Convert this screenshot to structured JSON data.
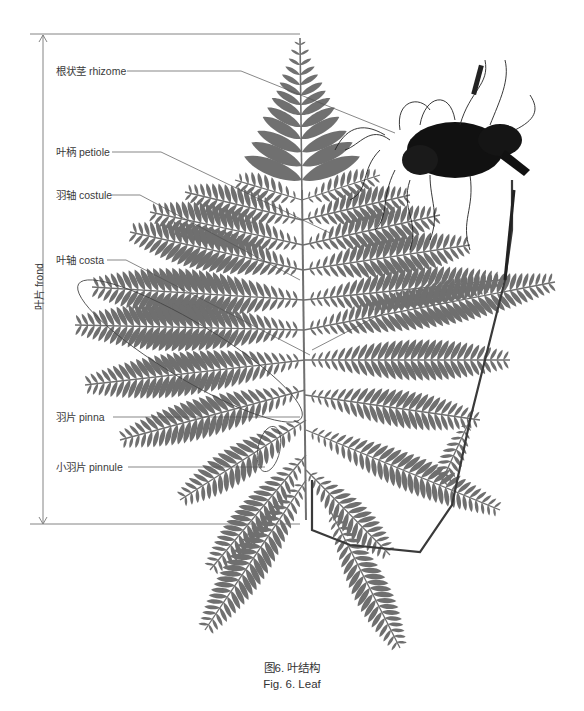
{
  "figure": {
    "labels": {
      "rhizome": "根状茎 rhizome",
      "petiole": "叶柄 petiole",
      "costule": "羽轴 costule",
      "costa": "叶轴 costa",
      "pinna": "羽片 pinna",
      "pinnule": "小羽片 pinnule"
    },
    "dimension_label": "叶片 frond",
    "caption_cn": "图6. 叶结构",
    "caption_en": "Fig. 6. Leaf",
    "colors": {
      "frond": "#6f6f6f",
      "rhizome": "#111111",
      "leader_line": "#5a5a5a",
      "text": "#3a3a3a"
    }
  }
}
